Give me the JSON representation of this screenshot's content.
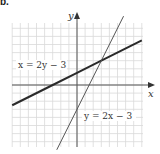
{
  "problem_label": "b.",
  "chart_data": {
    "type": "line",
    "title": "",
    "xlabel": "x",
    "ylabel": "y",
    "xlim": [
      -8,
      8
    ],
    "ylim": [
      -8,
      7.5
    ],
    "grid": true,
    "grid_spacing": 1,
    "legend": "none (inline labels)",
    "series": [
      {
        "name": "x = 2y − 3",
        "equation": "y = (x + 3) / 2",
        "x": [
          -8,
          -3,
          0,
          3,
          8
        ],
        "y": [
          -2.5,
          0,
          1.5,
          3,
          5.5
        ],
        "stroke": "#2a2a2a",
        "stroke_width": 2,
        "label_position": [
          -7,
          1.8
        ]
      },
      {
        "name": "y = 2x − 3",
        "equation": "y = 2x − 3",
        "x": [
          -2.5,
          0,
          1.5,
          3,
          5.75
        ],
        "y": [
          -8,
          -3,
          0,
          3,
          8.5
        ],
        "stroke": "#555555",
        "stroke_width": 1,
        "label_position": [
          1.2,
          -3.7
        ]
      }
    ],
    "annotations": [
      {
        "text": "x = 2y − 3",
        "at": [
          -7,
          1.8
        ]
      },
      {
        "text": "y = 2x − 3",
        "at": [
          1.2,
          -3.7
        ]
      }
    ],
    "intersection": [
      3,
      3
    ]
  },
  "labels": {
    "eq1": "x = 2y − 3",
    "eq2": "y = 2x − 3",
    "x_axis": "x",
    "y_axis": "y"
  },
  "colors": {
    "grid": "#d9d9d9",
    "axis": "#555555",
    "line_thick": "#2a2a2a",
    "line_thin": "#555555"
  }
}
